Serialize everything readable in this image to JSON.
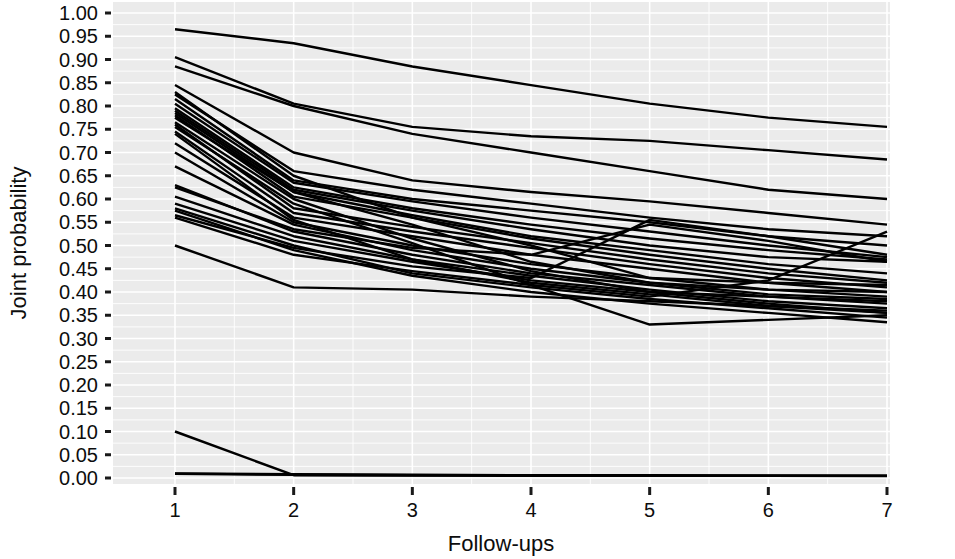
{
  "chart_data": {
    "type": "line",
    "title": "",
    "subtitle": "",
    "xlabel": "Follow-ups",
    "ylabel": "Joint probability",
    "x": [
      1,
      2,
      3,
      4,
      5,
      6,
      7
    ],
    "xlim": [
      1,
      7
    ],
    "ylim": [
      0.0,
      1.0
    ],
    "xticks": [
      "1",
      "2",
      "3",
      "4",
      "5",
      "6",
      "7"
    ],
    "yticks": [
      "0.00",
      "0.05",
      "0.10",
      "0.15",
      "0.20",
      "0.25",
      "0.30",
      "0.35",
      "0.40",
      "0.45",
      "0.50",
      "0.55",
      "0.60",
      "0.65",
      "0.70",
      "0.75",
      "0.80",
      "0.85",
      "0.90",
      "0.95",
      "1.00"
    ],
    "grid": true,
    "grid_color": "#ffffff",
    "panel_background": "#ebebeb",
    "line_color": "#000000",
    "legend": null,
    "legend_position": "none",
    "series": [
      {
        "name": "s01",
        "values": [
          0.965,
          0.935,
          0.885,
          0.845,
          0.805,
          0.775,
          0.755
        ]
      },
      {
        "name": "s02",
        "values": [
          0.905,
          0.805,
          0.755,
          0.735,
          0.725,
          0.705,
          0.685
        ]
      },
      {
        "name": "s03",
        "values": [
          0.885,
          0.8,
          0.74,
          0.7,
          0.66,
          0.62,
          0.6
        ]
      },
      {
        "name": "s04",
        "values": [
          0.845,
          0.7,
          0.64,
          0.615,
          0.595,
          0.57,
          0.545
        ]
      },
      {
        "name": "s05",
        "values": [
          0.825,
          0.66,
          0.62,
          0.59,
          0.56,
          0.535,
          0.52
        ]
      },
      {
        "name": "s06",
        "values": [
          0.815,
          0.64,
          0.6,
          0.575,
          0.55,
          0.52,
          0.5
        ]
      },
      {
        "name": "s07",
        "values": [
          0.805,
          0.635,
          0.595,
          0.56,
          0.53,
          0.5,
          0.475
        ]
      },
      {
        "name": "s08",
        "values": [
          0.795,
          0.625,
          0.58,
          0.545,
          0.515,
          0.49,
          0.47
        ]
      },
      {
        "name": "s09",
        "values": [
          0.79,
          0.62,
          0.575,
          0.535,
          0.5,
          0.475,
          0.465
        ]
      },
      {
        "name": "s10",
        "values": [
          0.785,
          0.615,
          0.565,
          0.52,
          0.49,
          0.46,
          0.44
        ]
      },
      {
        "name": "s11",
        "values": [
          0.78,
          0.605,
          0.56,
          0.515,
          0.48,
          0.45,
          0.425
        ]
      },
      {
        "name": "s12",
        "values": [
          0.76,
          0.58,
          0.54,
          0.505,
          0.47,
          0.44,
          0.42
        ]
      },
      {
        "name": "s13",
        "values": [
          0.745,
          0.57,
          0.53,
          0.495,
          0.46,
          0.43,
          0.41
        ]
      },
      {
        "name": "s14",
        "values": [
          0.72,
          0.56,
          0.52,
          0.48,
          0.45,
          0.42,
          0.4
        ]
      },
      {
        "name": "s15",
        "values": [
          0.7,
          0.55,
          0.5,
          0.46,
          0.43,
          0.405,
          0.39
        ]
      },
      {
        "name": "s16",
        "values": [
          0.67,
          0.545,
          0.49,
          0.45,
          0.42,
          0.395,
          0.385
        ]
      },
      {
        "name": "s17",
        "values": [
          0.63,
          0.53,
          0.48,
          0.44,
          0.415,
          0.39,
          0.375
        ]
      },
      {
        "name": "s18",
        "values": [
          0.605,
          0.52,
          0.47,
          0.435,
          0.405,
          0.38,
          0.365
        ]
      },
      {
        "name": "s19",
        "values": [
          0.59,
          0.51,
          0.465,
          0.425,
          0.4,
          0.375,
          0.355
        ]
      },
      {
        "name": "s20",
        "values": [
          0.58,
          0.5,
          0.44,
          0.41,
          0.385,
          0.365,
          0.345
        ]
      },
      {
        "name": "s21",
        "values": [
          0.575,
          0.49,
          0.435,
          0.4,
          0.375,
          0.355,
          0.335
        ]
      },
      {
        "name": "s22",
        "values": [
          0.83,
          0.65,
          0.56,
          0.5,
          0.43,
          0.42,
          0.415
        ]
      },
      {
        "name": "s23",
        "values": [
          0.775,
          0.615,
          0.545,
          0.465,
          0.42,
          0.405,
          0.4
        ]
      },
      {
        "name": "s24",
        "values": [
          0.765,
          0.6,
          0.515,
          0.445,
          0.4,
          0.39,
          0.38
        ]
      },
      {
        "name": "s25",
        "values": [
          0.755,
          0.59,
          0.505,
          0.415,
          0.33,
          0.34,
          0.35
        ]
      },
      {
        "name": "s26",
        "values": [
          0.74,
          0.555,
          0.47,
          0.42,
          0.395,
          0.37,
          0.36
        ]
      },
      {
        "name": "s27",
        "values": [
          0.625,
          0.535,
          0.495,
          0.48,
          0.545,
          0.51,
          0.465
        ]
      },
      {
        "name": "s28",
        "values": [
          0.565,
          0.495,
          0.455,
          0.43,
          0.555,
          0.52,
          0.48
        ]
      },
      {
        "name": "s29",
        "values": [
          0.5,
          0.41,
          0.405,
          0.39,
          0.38,
          0.37,
          0.355
        ]
      },
      {
        "name": "s30",
        "values": [
          0.56,
          0.48,
          0.445,
          0.415,
          0.39,
          0.425,
          0.53
        ]
      },
      {
        "name": "s31",
        "values": [
          0.1,
          0.006,
          0.005,
          0.005,
          0.005,
          0.005,
          0.005
        ]
      },
      {
        "name": "s32",
        "values": [
          0.01,
          0.008,
          0.007,
          0.006,
          0.006,
          0.005,
          0.005
        ]
      },
      {
        "name": "s33",
        "values": [
          0.009,
          0.007,
          0.006,
          0.006,
          0.005,
          0.005,
          0.004
        ]
      }
    ]
  },
  "figure": {
    "width": 955,
    "height": 559
  }
}
